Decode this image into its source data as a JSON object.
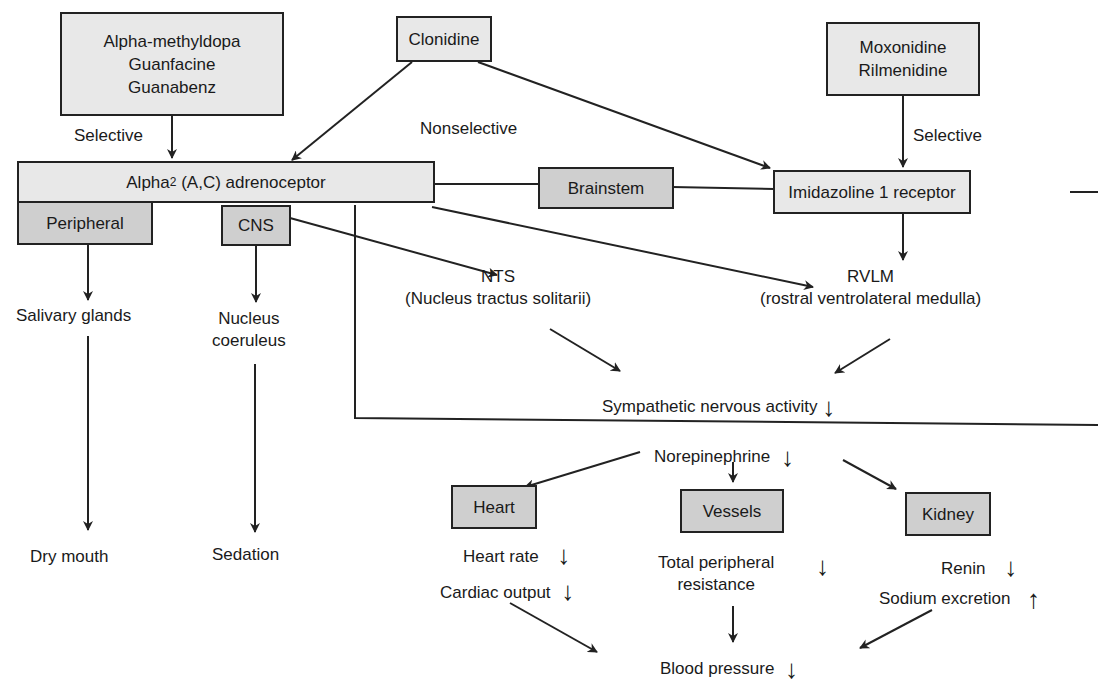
{
  "drugs": {
    "alpha_group": [
      "Alpha-methyldopa",
      "Guanfacine",
      "Guanabenz"
    ],
    "clonidine": "Clonidine",
    "imidazoline_group": [
      "Moxonidine",
      "Rilmenidine"
    ]
  },
  "edge_labels": {
    "selective_left": "Selective",
    "nonselective": "Nonselective",
    "selective_right": "Selective"
  },
  "receptors": {
    "alpha2_prefix": "Alpha",
    "alpha2_sub": "2",
    "alpha2_suffix": " (A,C) adrenoceptor",
    "brainstem": "Brainstem",
    "imidazoline": "Imidazoline 1 receptor"
  },
  "sites": {
    "peripheral": "Peripheral",
    "cns": "CNS",
    "salivary": "Salivary glands",
    "coeruleus_1": "Nucleus",
    "coeruleus_2": "coeruleus",
    "nts_1": "NTS",
    "nts_2": "(Nucleus tractus solitarii)",
    "rvlm_1": "RVLM",
    "rvlm_2": "(rostral ventrolateral medulla)"
  },
  "effects": {
    "dry_mouth": "Dry mouth",
    "sedation": "Sedation",
    "sympathetic": "Sympathetic nervous activity",
    "norepinephrine": "Norepinephrine",
    "heart": "Heart",
    "vessels": "Vessels",
    "kidney": "Kidney",
    "heart_rate": "Heart rate",
    "cardiac_output": "Cardiac output",
    "tpr_1": "Total peripheral",
    "tpr_2": "resistance",
    "renin": "Renin",
    "sodium": "Sodium excretion",
    "bp": "Blood pressure"
  },
  "indicators": {
    "down": "↓",
    "up": "↑"
  },
  "colors": {
    "light_box": "#e8e8e8",
    "dark_box": "#cfcfcf",
    "line": "#222222"
  }
}
